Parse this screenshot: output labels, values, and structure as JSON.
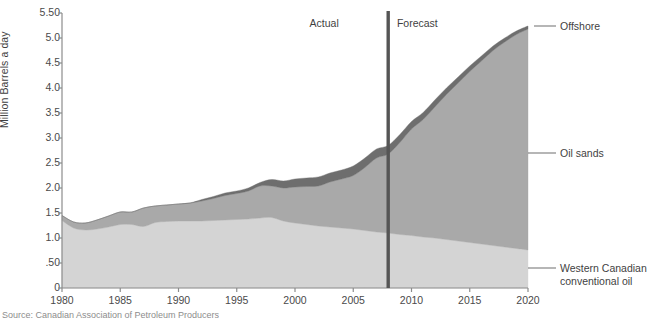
{
  "chart_data": {
    "type": "area",
    "title": "",
    "subtitle": "",
    "xlabel": "",
    "ylabel": "Million Barrels a day",
    "stacked": true,
    "grid": false,
    "legend_position": "right-outside",
    "xlim": [
      1980,
      2020
    ],
    "ylim": [
      0,
      5.5
    ],
    "ytick_labels": [
      "0",
      ".50",
      "1.0",
      "1.5",
      "2.0",
      "2.5",
      "3.0",
      "3.5",
      "4.0",
      "4.5",
      "5.0",
      "5.50"
    ],
    "ytick_values": [
      0,
      0.5,
      1.0,
      1.5,
      2.0,
      2.5,
      3.0,
      3.5,
      4.0,
      4.5,
      5.0,
      5.5
    ],
    "xtick_labels": [
      "1980",
      "1985",
      "1990",
      "1995",
      "2000",
      "2005",
      "2010",
      "2015",
      "2020"
    ],
    "xtick_values": [
      1980,
      1985,
      1990,
      1995,
      2000,
      2005,
      2010,
      2015,
      2020
    ],
    "x": [
      1980,
      1981,
      1982,
      1983,
      1984,
      1985,
      1986,
      1987,
      1988,
      1989,
      1990,
      1991,
      1992,
      1993,
      1994,
      1995,
      1996,
      1997,
      1998,
      1999,
      2000,
      2001,
      2002,
      2003,
      2004,
      2005,
      2006,
      2007,
      2008,
      2009,
      2010,
      2011,
      2012,
      2013,
      2014,
      2015,
      2016,
      2017,
      2018,
      2019,
      2020
    ],
    "series": [
      {
        "name": "Western Canadian conventional oil",
        "color": "#d4d4d4",
        "values": [
          1.35,
          1.2,
          1.16,
          1.18,
          1.22,
          1.27,
          1.27,
          1.23,
          1.31,
          1.33,
          1.34,
          1.34,
          1.34,
          1.35,
          1.36,
          1.37,
          1.38,
          1.4,
          1.41,
          1.34,
          1.3,
          1.27,
          1.24,
          1.22,
          1.2,
          1.18,
          1.15,
          1.12,
          1.1,
          1.07,
          1.05,
          1.02,
          1.0,
          0.97,
          0.94,
          0.91,
          0.88,
          0.85,
          0.82,
          0.79,
          0.76
        ]
      },
      {
        "name": "Oil sands",
        "color": "#a9a9a9",
        "values": [
          0.1,
          0.12,
          0.14,
          0.18,
          0.22,
          0.25,
          0.25,
          0.37,
          0.33,
          0.33,
          0.34,
          0.36,
          0.4,
          0.44,
          0.49,
          0.52,
          0.56,
          0.64,
          0.63,
          0.66,
          0.72,
          0.76,
          0.8,
          0.9,
          0.98,
          1.07,
          1.26,
          1.48,
          1.58,
          1.84,
          2.13,
          2.35,
          2.62,
          2.9,
          3.16,
          3.42,
          3.66,
          3.9,
          4.1,
          4.28,
          4.42
        ]
      },
      {
        "name": "Offshore",
        "color": "#6e6e6e",
        "values": [
          0.0,
          0.0,
          0.0,
          0.0,
          0.0,
          0.0,
          0.0,
          0.0,
          0.0,
          0.0,
          0.0,
          0.0,
          0.03,
          0.04,
          0.05,
          0.05,
          0.06,
          0.07,
          0.13,
          0.14,
          0.16,
          0.17,
          0.18,
          0.18,
          0.18,
          0.19,
          0.19,
          0.18,
          0.17,
          0.16,
          0.15,
          0.14,
          0.14,
          0.13,
          0.12,
          0.11,
          0.1,
          0.09,
          0.08,
          0.07,
          0.06
        ]
      }
    ],
    "annotations": [
      {
        "name": "actual",
        "label": "Actual",
        "x": 2002.5
      },
      {
        "name": "forecast",
        "label": "Forecast",
        "x": 2010.5
      }
    ],
    "divider": {
      "x": 2008,
      "color": "#555555"
    }
  },
  "labels": {
    "axis_y_title": "Million Barrels a day",
    "offshore": "Offshore",
    "oil_sands": "Oil sands",
    "western_line1": "Western Canadian",
    "western_line2": "conventional oil",
    "actual": "Actual",
    "forecast": "Forecast"
  },
  "footnote": "Source: Canadian Association of Petroleum Producers"
}
